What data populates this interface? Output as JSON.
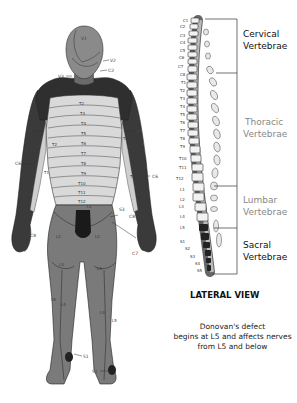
{
  "figure": {
    "title": "LATERAL VIEW",
    "note_lines": [
      "Donovan's defect",
      "begins at L5 and affects nerves",
      "from L5 and below"
    ]
  },
  "spine": {
    "regions": [
      {
        "name": "Cervical",
        "suffix": "Vertebrae",
        "color": "#111111",
        "bold": false
      },
      {
        "name": "Thoracic",
        "suffix": "Vertebrae",
        "color": "#888888",
        "bold": false
      },
      {
        "name": "Lumbar",
        "suffix": "Vertebrae",
        "color": "#888888",
        "bold": false
      },
      {
        "name": "Sacral",
        "suffix": "Vertebrae",
        "color": "#111111",
        "bold": false
      }
    ],
    "vertebra_labels": [
      "C1",
      "C2",
      "C3",
      "C4",
      "C5",
      "C6",
      "C7",
      "C8",
      "T1",
      "T2",
      "T3",
      "T4",
      "T5",
      "T6",
      "T7",
      "T8",
      "T9",
      "T10",
      "T11",
      "T12",
      "L1",
      "L2",
      "L3",
      "L4",
      "L5",
      "S1",
      "S2",
      "S3",
      "S4",
      "S5"
    ]
  },
  "body": {
    "head_labels": [
      "V1",
      "V2",
      "C2",
      "V3"
    ],
    "torso_labels": [
      "T2",
      "T3",
      "T4",
      "T5",
      "T6",
      "T7",
      "T8",
      "T9",
      "T10",
      "T11",
      "T12"
    ],
    "arm_labels": [
      "C5",
      "C5",
      "T2",
      "T2",
      "C6",
      "C6",
      "T1",
      "T1",
      "C8",
      "C8",
      "C7",
      "C7"
    ],
    "groin_labels": [
      "L1",
      "S3"
    ],
    "leg_labels": [
      "L2",
      "L2",
      "L3",
      "L3",
      "L5",
      "L5",
      "L4",
      "L4",
      "S1",
      "S1"
    ]
  }
}
